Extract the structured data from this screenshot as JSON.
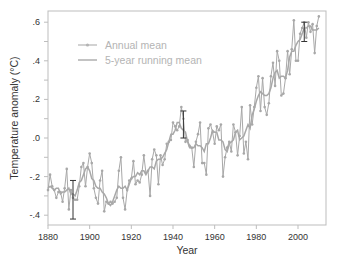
{
  "chart_data": {
    "type": "line",
    "title": "",
    "xlabel": "Year",
    "ylabel": "Temperature anomaly (°C)",
    "xlim": [
      1880,
      2014
    ],
    "ylim": [
      -0.45,
      0.65
    ],
    "x_ticks": [
      1880,
      1900,
      1920,
      1940,
      1960,
      1980,
      2000
    ],
    "x_tick_labels": [
      "1880",
      "1900",
      "1920",
      "1940",
      "1960",
      "1980",
      "2000"
    ],
    "y_ticks": [
      0.6,
      0.5,
      0.4,
      0.3,
      0.2,
      0.1,
      0.0,
      -0.1,
      -0.2,
      -0.3,
      -0.4
    ],
    "y_tick_labels": [
      ".6",
      "",
      ".4",
      "",
      ".2",
      "",
      ".0",
      "",
      "-.2",
      "",
      "-.4"
    ],
    "grid": false,
    "legend_position": "upper left",
    "legend": [
      "Annual mean",
      "5-year running mean"
    ],
    "x": [
      1880,
      1881,
      1882,
      1883,
      1884,
      1885,
      1886,
      1887,
      1888,
      1889,
      1890,
      1891,
      1892,
      1893,
      1894,
      1895,
      1896,
      1897,
      1898,
      1899,
      1900,
      1901,
      1902,
      1903,
      1904,
      1905,
      1906,
      1907,
      1908,
      1909,
      1910,
      1911,
      1912,
      1913,
      1914,
      1915,
      1916,
      1917,
      1918,
      1919,
      1920,
      1921,
      1922,
      1923,
      1924,
      1925,
      1926,
      1927,
      1928,
      1929,
      1930,
      1931,
      1932,
      1933,
      1934,
      1935,
      1936,
      1937,
      1938,
      1939,
      1940,
      1941,
      1942,
      1943,
      1944,
      1945,
      1946,
      1947,
      1948,
      1949,
      1950,
      1951,
      1952,
      1953,
      1954,
      1955,
      1956,
      1957,
      1958,
      1959,
      1960,
      1961,
      1962,
      1963,
      1964,
      1965,
      1966,
      1967,
      1968,
      1969,
      1970,
      1971,
      1972,
      1973,
      1974,
      1975,
      1976,
      1977,
      1978,
      1979,
      1980,
      1981,
      1982,
      1983,
      1984,
      1985,
      1986,
      1987,
      1988,
      1989,
      1990,
      1991,
      1992,
      1993,
      1994,
      1995,
      1996,
      1997,
      1998,
      1999,
      2000,
      2001,
      2002,
      2003,
      2004,
      2005,
      2006,
      2007,
      2008,
      2009,
      2010
    ],
    "series": [
      {
        "name": "Annual mean",
        "values": [
          -0.27,
          -0.19,
          -0.25,
          -0.27,
          -0.31,
          -0.28,
          -0.28,
          -0.33,
          -0.26,
          -0.16,
          -0.37,
          -0.27,
          -0.31,
          -0.32,
          -0.32,
          -0.25,
          -0.15,
          -0.13,
          -0.25,
          -0.15,
          -0.08,
          -0.13,
          -0.26,
          -0.31,
          -0.34,
          -0.22,
          -0.17,
          -0.38,
          -0.33,
          -0.34,
          -0.33,
          -0.34,
          -0.33,
          -0.31,
          -0.17,
          -0.1,
          -0.31,
          -0.37,
          -0.27,
          -0.22,
          -0.21,
          -0.12,
          -0.24,
          -0.22,
          -0.23,
          -0.19,
          -0.09,
          -0.18,
          -0.17,
          -0.3,
          -0.11,
          -0.06,
          -0.09,
          -0.24,
          -0.09,
          -0.14,
          -0.11,
          -0.03,
          -0.02,
          -0.01,
          0.08,
          0.06,
          0.04,
          0.06,
          0.16,
          0.1,
          -0.02,
          -0.01,
          -0.04,
          -0.05,
          -0.15,
          -0.02,
          0.02,
          0.08,
          -0.13,
          -0.13,
          -0.19,
          0.05,
          0.07,
          0.03,
          -0.03,
          0.06,
          0.04,
          0.07,
          -0.2,
          -0.1,
          -0.05,
          -0.02,
          -0.07,
          0.07,
          0.03,
          -0.09,
          0.01,
          0.16,
          -0.08,
          -0.02,
          -0.11,
          0.17,
          0.07,
          0.16,
          0.26,
          0.32,
          0.14,
          0.31,
          0.16,
          0.12,
          0.18,
          0.32,
          0.39,
          0.27,
          0.45,
          0.4,
          0.22,
          0.23,
          0.31,
          0.45,
          0.33,
          0.46,
          0.61,
          0.4,
          0.4,
          0.54,
          0.57,
          0.6,
          0.52,
          0.6,
          0.55,
          0.59,
          0.44,
          0.58,
          0.63
        ]
      },
      {
        "name": "5-year running mean",
        "values": [
          -0.26,
          -0.25,
          -0.26,
          -0.27,
          -0.26,
          -0.26,
          -0.29,
          -0.28,
          -0.28,
          -0.27,
          -0.26,
          -0.29,
          -0.29,
          -0.3,
          -0.27,
          -0.23,
          -0.22,
          -0.19,
          -0.16,
          -0.15,
          -0.17,
          -0.21,
          -0.22,
          -0.25,
          -0.26,
          -0.26,
          -0.28,
          -0.29,
          -0.31,
          -0.34,
          -0.35,
          -0.33,
          -0.3,
          -0.27,
          -0.25,
          -0.26,
          -0.26,
          -0.25,
          -0.27,
          -0.24,
          -0.21,
          -0.2,
          -0.2,
          -0.18,
          -0.19,
          -0.17,
          -0.17,
          -0.19,
          -0.17,
          -0.15,
          -0.15,
          -0.16,
          -0.12,
          -0.11,
          -0.11,
          -0.1,
          -0.08,
          -0.06,
          -0.02,
          0.02,
          0.02,
          0.04,
          0.08,
          0.08,
          0.05,
          0.04,
          0.03,
          -0.02,
          -0.05,
          -0.05,
          -0.05,
          -0.03,
          -0.04,
          -0.04,
          -0.05,
          -0.07,
          -0.03,
          -0.03,
          0.0,
          0.04,
          0.03,
          0.03,
          -0.01,
          -0.01,
          -0.02,
          -0.06,
          -0.07,
          -0.03,
          -0.02,
          -0.01,
          0.03,
          0.04,
          -0.01,
          0.0,
          0.01,
          0.04,
          0.07,
          0.05,
          0.12,
          0.15,
          0.19,
          0.22,
          0.24,
          0.23,
          0.22,
          0.22,
          0.23,
          0.26,
          0.31,
          0.34,
          0.35,
          0.31,
          0.32,
          0.32,
          0.31,
          0.35,
          0.42,
          0.45,
          0.45,
          0.48,
          0.5,
          0.51,
          0.54,
          0.57,
          0.57,
          0.58,
          0.58,
          0.56,
          0.56,
          0.56,
          0.57
        ]
      }
    ],
    "error_bars": [
      {
        "x": 1892,
        "low": -0.42,
        "high": -0.22
      },
      {
        "x": 1945,
        "low": 0.0,
        "high": 0.14
      },
      {
        "x": 2003,
        "low": 0.5,
        "high": 0.6
      }
    ]
  }
}
